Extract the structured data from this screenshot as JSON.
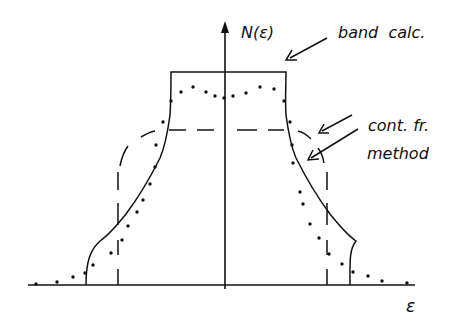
{
  "diagram": {
    "y_axis_label": "N(ε)",
    "x_axis_label": "ε",
    "annotations": {
      "band_calc": "band  calc.",
      "cont_fr_line1": "cont. fr.",
      "cont_fr_line2": "method"
    },
    "curves": [
      {
        "name": "band calculation",
        "style": "solid"
      },
      {
        "name": "continued fraction method",
        "style": "dashed"
      },
      {
        "name": "continued fraction method",
        "style": "dotted"
      }
    ],
    "ink_color": "#111111",
    "background_color": "#ffffff"
  }
}
